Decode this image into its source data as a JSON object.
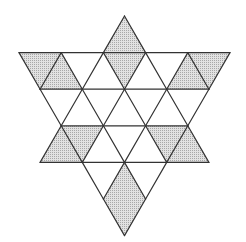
{
  "diagram": {
    "title": "",
    "type": "six-pointed star on triangular grid",
    "colors": {
      "background": "#ffffff",
      "stroke": "#333333",
      "shade": "#c9c9c9"
    },
    "grid": {
      "side": 42.2,
      "row_height": 36.6,
      "rows_y": [
        16,
        52.6,
        89.2,
        125.8,
        162.4,
        199,
        235.6
      ]
    },
    "up_triangle": {
      "tip": [
        124.5,
        16
      ],
      "base_y": 162.4,
      "base_x": [
        40,
        209
      ]
    },
    "down_triangle": {
      "base_y": 52.6,
      "base_x": [
        19,
        230
      ],
      "tip": [
        124.5,
        235.6
      ]
    },
    "shaded_regions": [
      {
        "name": "top-diamond",
        "points": [
          [
            124.5,
            16
          ],
          [
            145.6,
            52.6
          ],
          [
            124.5,
            89.2
          ],
          [
            103.4,
            52.6
          ]
        ]
      },
      {
        "name": "top-left-parallelogram",
        "points": [
          [
            19,
            52.6
          ],
          [
            61.2,
            52.6
          ],
          [
            82.3,
            89.2
          ],
          [
            40.1,
            89.2
          ]
        ]
      },
      {
        "name": "top-right-parallelogram",
        "points": [
          [
            187.8,
            52.6
          ],
          [
            230,
            52.6
          ],
          [
            208.9,
            89.2
          ],
          [
            166.7,
            89.2
          ]
        ]
      },
      {
        "name": "middle-left-parallelogram",
        "points": [
          [
            61.2,
            125.8
          ],
          [
            103.4,
            125.8
          ],
          [
            82.3,
            162.4
          ],
          [
            40.1,
            162.4
          ]
        ]
      },
      {
        "name": "middle-right-parallelogram",
        "points": [
          [
            145.6,
            125.8
          ],
          [
            187.8,
            125.8
          ],
          [
            208.9,
            162.4
          ],
          [
            166.7,
            162.4
          ]
        ]
      },
      {
        "name": "bottom-diamond",
        "points": [
          [
            124.5,
            162.4
          ],
          [
            145.6,
            199
          ],
          [
            124.5,
            235.6
          ],
          [
            103.4,
            199
          ]
        ]
      }
    ]
  }
}
